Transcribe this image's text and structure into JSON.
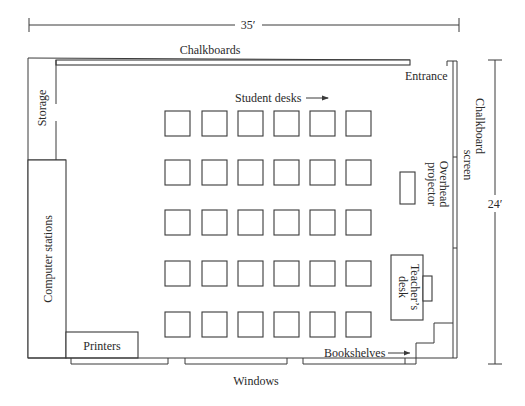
{
  "diagram": {
    "type": "classroom floor plan",
    "dimensions": {
      "width_label": "35′",
      "height_label": "24′"
    },
    "labels": {
      "chalkboards": "Chalkboards",
      "entrance": "Entrance",
      "storage": "Storage",
      "student_desks": "Student desks",
      "chalkboard_screen_line1": "Chalkboard",
      "chalkboard_screen_line2": "screen",
      "overhead_projector_line1": "Overhead",
      "overhead_projector_line2": "projector",
      "computer_stations": "Computer stations",
      "teachers_desk_line1": "Teacher’s",
      "teachers_desk_line2": "desk",
      "printers": "Printers",
      "bookshelves": "Bookshelves",
      "windows": "Windows"
    },
    "student_desk_grid": {
      "rows": 5,
      "columns": 6,
      "count": 30
    },
    "colors": {
      "line": "#3a3a3a",
      "text": "#2a2a2a",
      "background": "#ffffff"
    }
  }
}
